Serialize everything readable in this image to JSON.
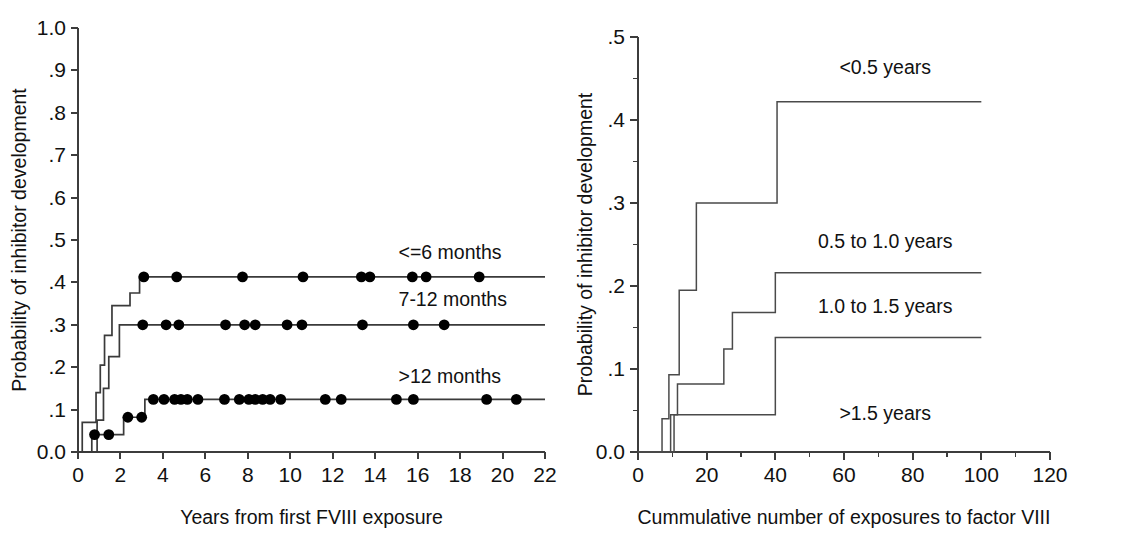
{
  "figure": {
    "background": "#ffffff",
    "line_color": "#3a3a3a",
    "text_color": "#111111",
    "marker_color": "#000000"
  },
  "chart_data": [
    {
      "type": "line",
      "panel": "left",
      "title": "",
      "xlabel": "Years from first FVIII exposure",
      "ylabel": "Probability of inhibitor development",
      "xlim": [
        0,
        22
      ],
      "ylim": [
        0.0,
        1.0
      ],
      "xticks": [
        0,
        2,
        4,
        6,
        8,
        10,
        12,
        14,
        16,
        18,
        20,
        22
      ],
      "xticklabels": [
        "0",
        "2",
        "4",
        "6",
        "8",
        "10",
        "12",
        "14",
        "16",
        "18",
        "20",
        "22"
      ],
      "yticks": [
        0.0,
        0.1,
        0.2,
        0.3,
        0.4,
        0.5,
        0.6,
        0.7,
        0.8,
        0.9,
        1.0
      ],
      "yticklabels": [
        "0.0",
        ".1",
        ".2",
        ".3",
        ".4",
        ".5",
        ".6",
        ".7",
        ".8",
        ".9",
        "1.0"
      ],
      "grid": false,
      "legend_position": "inline-right-of-curve",
      "step_type": "post",
      "series": [
        {
          "name": "<=6 months",
          "label": "<=6 months",
          "label_x": 15.1,
          "label_y": 0.455,
          "plateau": 0.413,
          "steps": [
            [
              0.0,
              0.0
            ],
            [
              0.2,
              0.07
            ],
            [
              0.85,
              0.14
            ],
            [
              1.05,
              0.205
            ],
            [
              1.25,
              0.275
            ],
            [
              1.6,
              0.345
            ],
            [
              2.05,
              0.345
            ],
            [
              2.45,
              0.375
            ],
            [
              2.9,
              0.413
            ],
            [
              22.0,
              0.413
            ]
          ],
          "censor_x": [
            3.1,
            4.65,
            7.75,
            10.6,
            13.35,
            13.75,
            15.75,
            16.4,
            18.9
          ],
          "censor_y": 0.413
        },
        {
          "name": "7-12 months",
          "label": "7-12 months",
          "label_x": 15.1,
          "label_y": 0.345,
          "plateau": 0.3,
          "steps": [
            [
              0.0,
              0.0
            ],
            [
              0.55,
              0.0
            ],
            [
              0.9,
              0.075
            ],
            [
              1.2,
              0.15
            ],
            [
              1.45,
              0.225
            ],
            [
              1.95,
              0.3
            ],
            [
              22.0,
              0.3
            ]
          ],
          "censor_x": [
            3.05,
            4.15,
            4.75,
            6.95,
            7.85,
            8.35,
            9.85,
            10.55,
            13.4,
            15.8,
            17.25
          ],
          "censor_y": 0.3
        },
        {
          "name": ">12 months",
          "label": ">12 months",
          "label_x": 15.1,
          "label_y": 0.162,
          "plateau": 0.124,
          "steps": [
            [
              0.0,
              0.0
            ],
            [
              0.35,
              0.0
            ],
            [
              0.65,
              0.041
            ],
            [
              1.85,
              0.041
            ],
            [
              2.15,
              0.082
            ],
            [
              3.0,
              0.082
            ],
            [
              3.15,
              0.124
            ],
            [
              22.0,
              0.124
            ]
          ],
          "censor_x": [
            0.78,
            1.45,
            2.35,
            3.0,
            3.55,
            4.05,
            4.55,
            4.85,
            5.15,
            5.65,
            6.9,
            7.6,
            8.05,
            8.35,
            8.7,
            9.05,
            9.55,
            11.65,
            12.4,
            15.0,
            15.8,
            19.25,
            20.65
          ],
          "censor_y_low1": 0.041,
          "censor_y_low2": 0.082,
          "censor_y": 0.124
        }
      ]
    },
    {
      "type": "line",
      "panel": "right",
      "title": "",
      "xlabel": "Cummulative number of exposures to factor VIII",
      "ylabel": "Probability of inhibitor development",
      "xlim": [
        0,
        120
      ],
      "ylim": [
        0.0,
        0.5
      ],
      "xticks": [
        0,
        20,
        40,
        60,
        80,
        100,
        120
      ],
      "xticklabels": [
        "0",
        "20",
        "40",
        "60",
        "80",
        "100",
        "120"
      ],
      "yticks": [
        0.0,
        0.1,
        0.2,
        0.3,
        0.4,
        0.5
      ],
      "yticklabels": [
        "0.0",
        ".1",
        ".2",
        ".3",
        ".4",
        ".5"
      ],
      "yminor": [
        0.05,
        0.15,
        0.25,
        0.35,
        0.45
      ],
      "xminor": [
        10,
        30,
        50,
        70,
        90,
        110
      ],
      "grid": false,
      "legend_position": "inline-above-curve",
      "step_type": "post",
      "series": [
        {
          "name": "<0.5 years",
          "label": "<0.5 years",
          "label_x": 72,
          "label_y": 0.455,
          "plateau": 0.422,
          "steps": [
            [
              0,
              0.0
            ],
            [
              7.0,
              0.0
            ],
            [
              7.0,
              0.04
            ],
            [
              9.0,
              0.04
            ],
            [
              9.0,
              0.093
            ],
            [
              12.0,
              0.093
            ],
            [
              12.0,
              0.195
            ],
            [
              17.0,
              0.195
            ],
            [
              17.0,
              0.3
            ],
            [
              40.5,
              0.3
            ],
            [
              40.5,
              0.422
            ],
            [
              100,
              0.422
            ]
          ]
        },
        {
          "name": "0.5 to 1.0 years",
          "label": "0.5 to 1.0 years",
          "label_x": 72,
          "label_y": 0.246,
          "plateau": 0.216,
          "steps": [
            [
              0,
              0.0
            ],
            [
              9.5,
              0.0
            ],
            [
              9.5,
              0.045
            ],
            [
              11.5,
              0.045
            ],
            [
              11.5,
              0.082
            ],
            [
              25.0,
              0.082
            ],
            [
              25.0,
              0.124
            ],
            [
              27.5,
              0.124
            ],
            [
              27.5,
              0.168
            ],
            [
              40.0,
              0.168
            ],
            [
              40.0,
              0.216
            ],
            [
              100,
              0.216
            ]
          ]
        },
        {
          "name": "1.0 to 1.5 years",
          "label": "1.0 to 1.5 years",
          "label_x": 72,
          "label_y": 0.168,
          "plateau": 0.138,
          "steps": [
            [
              0,
              0.0
            ],
            [
              10.5,
              0.0
            ],
            [
              10.5,
              0.045
            ],
            [
              40.0,
              0.045
            ],
            [
              40.0,
              0.138
            ],
            [
              100,
              0.138
            ]
          ]
        },
        {
          "name": ">1.5 years",
          "label": ">1.5 years",
          "label_x": 72,
          "label_y": 0.038,
          "plateau": 0.0,
          "steps": [
            [
              0,
              0.0
            ],
            [
              120,
              0.0
            ]
          ]
        }
      ]
    }
  ]
}
